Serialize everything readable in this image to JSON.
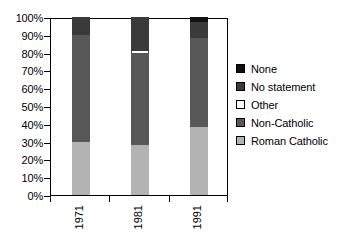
{
  "chart_data": {
    "type": "bar",
    "subtype": "stacked-percentage-column",
    "title": "",
    "subtitle": "",
    "xlabel": "",
    "ylabel": "",
    "categories": [
      "1971",
      "1981",
      "1991"
    ],
    "series": [
      {
        "name": "Roman Catholic",
        "color": "#b3b3b3",
        "values": [
          30,
          28,
          38
        ]
      },
      {
        "name": "Non-Catholic",
        "color": "#585858",
        "values": [
          60,
          52,
          50
        ]
      },
      {
        "name": "Other",
        "color": "#ffffff",
        "values": [
          0,
          1,
          0
        ]
      },
      {
        "name": "No statement",
        "color": "#3a3a3a",
        "values": [
          10,
          19,
          9
        ]
      },
      {
        "name": "None",
        "color": "#111111",
        "values": [
          0,
          0,
          3
        ]
      }
    ],
    "ylim": [
      0,
      100
    ],
    "yticks": [
      0,
      10,
      20,
      30,
      40,
      50,
      60,
      70,
      80,
      90,
      100
    ],
    "ytick_labels": [
      "0%",
      "10%",
      "20%",
      "30%",
      "40%",
      "50%",
      "60%",
      "70%",
      "80%",
      "90%",
      "100%"
    ],
    "grid": false,
    "legend_position": "right",
    "legend_order": [
      "None",
      "No statement",
      "Other",
      "Non-Catholic",
      "Roman Catholic"
    ]
  },
  "axes": {
    "y_tick_labels": [
      "100%",
      "90%",
      "80%",
      "70%",
      "60%",
      "50%",
      "40%",
      "30%",
      "20%",
      "10%",
      "0%"
    ],
    "x_tick_labels": [
      "1971",
      "1981",
      "1991"
    ]
  },
  "legend": {
    "items": [
      {
        "label": "None",
        "color": "#111111",
        "border": "#000000"
      },
      {
        "label": "No statement",
        "color": "#3a3a3a",
        "border": "#000000"
      },
      {
        "label": "Other",
        "color": "#ffffff",
        "border": "#000000"
      },
      {
        "label": "Non-Catholic",
        "color": "#585858",
        "border": "#000000"
      },
      {
        "label": "Roman Catholic",
        "color": "#b3b3b3",
        "border": "#000000"
      }
    ]
  }
}
